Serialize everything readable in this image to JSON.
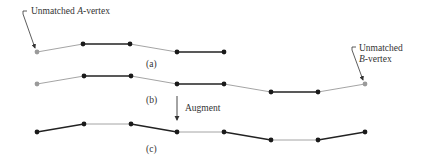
{
  "annotations": {
    "a_vertex": {
      "line1": "Unmatched ",
      "italic": "A",
      "line1_rest": "-vertex"
    },
    "b_vertex": {
      "line1": "Unmatched",
      "italic": "B",
      "line2_rest": "-vertex"
    },
    "augment": "Augment"
  },
  "panel_labels": {
    "a": "(a)",
    "b": "(b)",
    "c": "(c)"
  },
  "colors": {
    "matched_edge": "#222222",
    "unmatched_edge": "#9a9a9a",
    "vertex": "#1a1a1a",
    "free_vertex": "#9a9a9a"
  },
  "paths": {
    "a": {
      "vertices": [
        [
          37,
          52
        ],
        [
          83,
          44
        ],
        [
          130,
          44
        ],
        [
          177,
          52
        ],
        [
          224,
          52
        ]
      ],
      "free": [
        0
      ],
      "edge_matched": [
        false,
        true,
        false,
        true
      ]
    },
    "b": {
      "vertices": [
        [
          37,
          84
        ],
        [
          84,
          76
        ],
        [
          131,
          76
        ],
        [
          177,
          84
        ],
        [
          224,
          84
        ],
        [
          271,
          92
        ],
        [
          318,
          92
        ],
        [
          365,
          84
        ]
      ],
      "free": [
        0,
        7
      ],
      "edge_matched": [
        false,
        true,
        false,
        true,
        false,
        true,
        false
      ]
    },
    "c": {
      "vertices": [
        [
          37,
          132
        ],
        [
          84,
          124
        ],
        [
          131,
          124
        ],
        [
          177,
          132
        ],
        [
          224,
          132
        ],
        [
          271,
          140
        ],
        [
          318,
          140
        ],
        [
          365,
          132
        ]
      ],
      "free": [],
      "edge_matched": [
        true,
        false,
        true,
        false,
        true,
        false,
        true
      ]
    }
  }
}
